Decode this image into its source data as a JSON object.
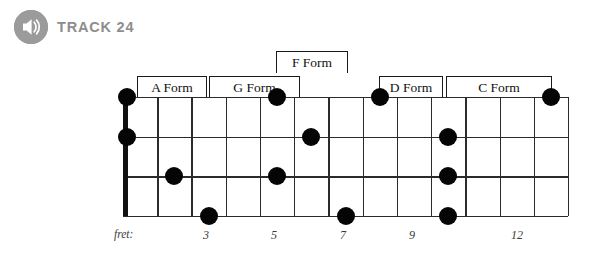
{
  "header": {
    "icon": "speaker-icon",
    "track_label": "TRACK 24"
  },
  "forms": [
    {
      "label": "A Form",
      "left": 137,
      "right": 207,
      "top": 76,
      "height": 22
    },
    {
      "label": "G Form",
      "left": 209,
      "right": 300,
      "top": 76,
      "height": 22
    },
    {
      "label": "F Form",
      "left": 276,
      "right": 348,
      "top": 51,
      "height": 22
    },
    {
      "label": "D Form",
      "left": 379,
      "right": 443,
      "top": 76,
      "height": 22
    },
    {
      "label": "C Form",
      "left": 446,
      "right": 552,
      "top": 76,
      "height": 22
    }
  ],
  "fretboard": {
    "left": 123,
    "top": 97,
    "right": 568,
    "bottom": 216,
    "strings": 4,
    "frets": 13,
    "nut_width": 5,
    "dot_radius": 9,
    "dots": [
      {
        "fret": 0,
        "string": 1
      },
      {
        "fret": 0,
        "string": 2
      },
      {
        "fret": 2,
        "string": 3
      },
      {
        "fret": 3,
        "string": 4
      },
      {
        "fret": 5,
        "string": 1
      },
      {
        "fret": 5,
        "string": 3
      },
      {
        "fret": 6,
        "string": 2
      },
      {
        "fret": 7,
        "string": 4
      },
      {
        "fret": 8,
        "string": 1
      },
      {
        "fret": 10,
        "string": 2
      },
      {
        "fret": 10,
        "string": 3
      },
      {
        "fret": 10,
        "string": 4
      },
      {
        "fret": 13,
        "string": 1
      }
    ]
  },
  "fret_axis": {
    "caption": "fret:",
    "caption_x": 114,
    "y": 228,
    "marks": [
      {
        "label": "3",
        "x": 206
      },
      {
        "label": "5",
        "x": 274
      },
      {
        "label": "7",
        "x": 343
      },
      {
        "label": "9",
        "x": 412
      },
      {
        "label": "12",
        "x": 517
      }
    ]
  },
  "colors": {
    "ink": "#111111",
    "grid": "#2b2b2b",
    "badge": "#9b9b9b",
    "track_text": "#8d8d8d",
    "dot": "#050505"
  }
}
